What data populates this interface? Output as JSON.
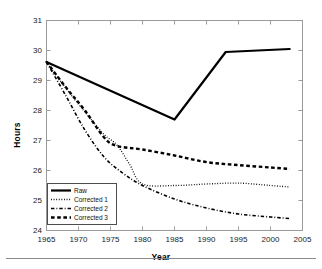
{
  "figure": {
    "background_color": "#ffffff",
    "line_color": "#000000",
    "axis_color": "#808080",
    "caption_partial_text": ""
  },
  "axes": {
    "ylabel": "Hours",
    "xlabel": "Year",
    "yticks": [
      "24",
      "25",
      "26",
      "27",
      "28",
      "29",
      "30",
      "31"
    ],
    "xticks": [
      "1965",
      "1970",
      "1975",
      "1980",
      "1985",
      "1990",
      "1995",
      "2000",
      "2005"
    ]
  },
  "legend": {
    "position": "lower-left",
    "items": [
      {
        "label": "Raw",
        "style": "solid"
      },
      {
        "label": "Corrected 1",
        "style": "dotted"
      },
      {
        "label": "Corrected 2",
        "style": "dashdot"
      },
      {
        "label": "Corrected 3",
        "style": "dashed"
      }
    ]
  },
  "chart_data": {
    "type": "line",
    "title": "",
    "xlabel": "Year",
    "ylabel": "Hours",
    "xlim": [
      1965,
      2005
    ],
    "ylim": [
      24,
      31
    ],
    "xticks": [
      1965,
      1970,
      1975,
      1980,
      1985,
      1990,
      1995,
      2000,
      2005
    ],
    "yticks": [
      24,
      25,
      26,
      27,
      28,
      29,
      30,
      31
    ],
    "grid": false,
    "legend_position": "lower left",
    "series": [
      {
        "name": "Raw",
        "style": "solid",
        "linewidth": 2.2,
        "x": [
          1965,
          1985,
          1993,
          2003
        ],
        "values": [
          29.62,
          27.7,
          29.95,
          30.05
        ]
      },
      {
        "name": "Corrected 1",
        "style": "dotted",
        "linewidth": 1.3,
        "x": [
          1965,
          1968,
          1971,
          1974,
          1976,
          1978,
          1980,
          1985,
          1990,
          1995,
          2000,
          2003
        ],
        "values": [
          29.62,
          28.75,
          27.95,
          27.2,
          26.85,
          26.2,
          25.55,
          25.5,
          25.55,
          25.58,
          25.5,
          25.45
        ]
      },
      {
        "name": "Corrected 2",
        "style": "dashdot",
        "linewidth": 1.6,
        "x": [
          1965,
          1968,
          1971,
          1974,
          1977,
          1980,
          1985,
          1990,
          1995,
          2000,
          2003
        ],
        "values": [
          29.62,
          28.5,
          27.35,
          26.45,
          25.9,
          25.5,
          25.05,
          24.75,
          24.55,
          24.45,
          24.4
        ]
      },
      {
        "name": "Corrected 3",
        "style": "dashed",
        "linewidth": 2.4,
        "x": [
          1965,
          1968,
          1971,
          1974,
          1976,
          1980,
          1985,
          1990,
          1995,
          2000,
          2003
        ],
        "values": [
          29.62,
          28.78,
          28.0,
          27.1,
          26.82,
          26.7,
          26.5,
          26.28,
          26.18,
          26.1,
          26.05
        ]
      }
    ]
  }
}
